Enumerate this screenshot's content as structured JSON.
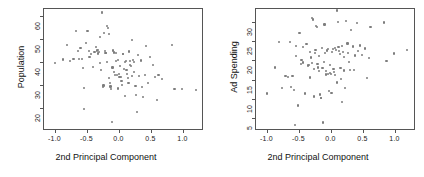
{
  "figure": {
    "type": "scatter-matrix-pair",
    "panel_count": 2,
    "point_color": "#7d7d7d",
    "axis_color": "#555555"
  },
  "chart_data": [
    {
      "type": "scatter",
      "title": "",
      "xlabel": "2nd Principal Component",
      "ylabel": "Population",
      "xlim": [
        -1.18,
        1.32
      ],
      "ylim": [
        10.5,
        63.5
      ],
      "xticks": [
        -1.0,
        -0.5,
        0.0,
        0.5,
        1.0
      ],
      "xticklabels": [
        "-1.0",
        "-0.5",
        "0.0",
        "0.5",
        "1.0"
      ],
      "yticks": [
        20,
        30,
        40,
        50,
        60
      ],
      "yticklabels": [
        "20",
        "30",
        "40",
        "50",
        "60"
      ],
      "grid": false,
      "legend": false,
      "n_points": 100,
      "points": [
        [
          -1.01,
          40.1
        ],
        [
          -0.88,
          41.6
        ],
        [
          -0.82,
          47.8
        ],
        [
          -0.78,
          41.0
        ],
        [
          -0.72,
          41.9
        ],
        [
          -0.68,
          54.1
        ],
        [
          -0.65,
          45.2
        ],
        [
          -0.63,
          41.9
        ],
        [
          -0.61,
          46.4
        ],
        [
          -0.59,
          41.8
        ],
        [
          -0.57,
          37.7
        ],
        [
          -0.56,
          29.2
        ],
        [
          -0.55,
          19.9
        ],
        [
          -0.52,
          48.9
        ],
        [
          -0.5,
          54.0
        ],
        [
          -0.48,
          45.4
        ],
        [
          -0.47,
          42.6
        ],
        [
          -0.44,
          43.8
        ],
        [
          -0.41,
          38.3
        ],
        [
          -0.39,
          44.9
        ],
        [
          -0.37,
          47.0
        ],
        [
          -0.35,
          45.5
        ],
        [
          -0.34,
          44.2
        ],
        [
          -0.33,
          45.8
        ],
        [
          -0.32,
          44.8
        ],
        [
          -0.31,
          40.0
        ],
        [
          -0.3,
          51.5
        ],
        [
          -0.29,
          37.0
        ],
        [
          -0.28,
          61.9
        ],
        [
          -0.27,
          62.2
        ],
        [
          -0.26,
          29.7
        ],
        [
          -0.25,
          30.3
        ],
        [
          -0.24,
          52.9
        ],
        [
          -0.23,
          45.3
        ],
        [
          -0.22,
          44.5
        ],
        [
          -0.21,
          44.4
        ],
        [
          -0.2,
          40.6
        ],
        [
          -0.19,
          56.0
        ],
        [
          -0.18,
          55.3
        ],
        [
          -0.17,
          52.6
        ],
        [
          -0.16,
          33.4
        ],
        [
          -0.15,
          31.2
        ],
        [
          -0.14,
          29.8
        ],
        [
          -0.13,
          28.9
        ],
        [
          -0.12,
          14.3
        ],
        [
          -0.11,
          38.1
        ],
        [
          -0.1,
          45.5
        ],
        [
          -0.09,
          44.6
        ],
        [
          -0.08,
          36.3
        ],
        [
          -0.07,
          35.0
        ],
        [
          -0.06,
          44.3
        ],
        [
          -0.05,
          40.8
        ],
        [
          -0.04,
          34.7
        ],
        [
          -0.03,
          41.2
        ],
        [
          -0.02,
          29.0
        ],
        [
          -0.01,
          35.3
        ],
        [
          0.0,
          33.8
        ],
        [
          0.01,
          38.6
        ],
        [
          0.02,
          34.1
        ],
        [
          0.03,
          32.2
        ],
        [
          0.04,
          30.5
        ],
        [
          0.05,
          43.8
        ],
        [
          0.06,
          44.0
        ],
        [
          0.07,
          37.3
        ],
        [
          0.08,
          25.7
        ],
        [
          0.09,
          40.3
        ],
        [
          0.1,
          41.0
        ],
        [
          0.11,
          36.9
        ],
        [
          0.12,
          35.4
        ],
        [
          0.13,
          33.5
        ],
        [
          0.14,
          31.4
        ],
        [
          0.15,
          45.0
        ],
        [
          0.16,
          40.9
        ],
        [
          0.17,
          39.3
        ],
        [
          0.18,
          38.8
        ],
        [
          0.19,
          34.3
        ],
        [
          0.2,
          50.1
        ],
        [
          0.21,
          41.5
        ],
        [
          0.22,
          40.4
        ],
        [
          0.23,
          36.0
        ],
        [
          0.25,
          30.0
        ],
        [
          0.26,
          26.2
        ],
        [
          0.27,
          18.8
        ],
        [
          0.29,
          43.5
        ],
        [
          0.31,
          34.4
        ],
        [
          0.33,
          41.1
        ],
        [
          0.35,
          29.6
        ],
        [
          0.37,
          25.2
        ],
        [
          0.4,
          34.9
        ],
        [
          0.42,
          47.3
        ],
        [
          0.45,
          31.4
        ],
        [
          0.48,
          42.8
        ],
        [
          0.52,
          39.0
        ],
        [
          0.55,
          34.0
        ],
        [
          0.58,
          23.9
        ],
        [
          0.61,
          35.0
        ],
        [
          0.66,
          33.2
        ],
        [
          0.82,
          47.8
        ],
        [
          0.86,
          28.6
        ],
        [
          0.98,
          28.8
        ],
        [
          1.2,
          28.2
        ]
      ]
    },
    {
      "type": "scatter",
      "title": "",
      "xlabel": "2nd Principal Component",
      "ylabel": "Ad Spending",
      "xlim": [
        -1.18,
        1.32
      ],
      "ylim": [
        2.0,
        33.5
      ],
      "xticks": [
        -1.0,
        -0.5,
        0.0,
        0.5,
        1.0
      ],
      "xticklabels": [
        "-1.0",
        "-0.5",
        "0.0",
        "0.5",
        "1.0"
      ],
      "yticks": [
        5,
        10,
        15,
        20,
        25,
        30
      ],
      "yticklabels": [
        "5",
        "10",
        "15",
        "20",
        "25",
        "30"
      ],
      "grid": false,
      "legend": false,
      "n_points": 100,
      "points": [
        [
          -1.01,
          11.7
        ],
        [
          -0.88,
          18.4
        ],
        [
          -0.82,
          25.0
        ],
        [
          -0.78,
          13.2
        ],
        [
          -0.72,
          16.2
        ],
        [
          -0.68,
          16.0
        ],
        [
          -0.65,
          25.0
        ],
        [
          -0.63,
          13.3
        ],
        [
          -0.61,
          16.1
        ],
        [
          -0.59,
          12.6
        ],
        [
          -0.57,
          3.6
        ],
        [
          -0.56,
          23.9
        ],
        [
          -0.55,
          21.3
        ],
        [
          -0.52,
          8.6
        ],
        [
          -0.5,
          27.4
        ],
        [
          -0.48,
          19.2
        ],
        [
          -0.47,
          20.3
        ],
        [
          -0.44,
          19.7
        ],
        [
          -0.41,
          11.7
        ],
        [
          -0.39,
          24.5
        ],
        [
          -0.37,
          18.9
        ],
        [
          -0.35,
          19.0
        ],
        [
          -0.34,
          15.8
        ],
        [
          -0.33,
          22.3
        ],
        [
          -0.32,
          21.0
        ],
        [
          -0.31,
          19.5
        ],
        [
          -0.3,
          31.1
        ],
        [
          -0.29,
          30.8
        ],
        [
          -0.28,
          10.9
        ],
        [
          -0.27,
          18.0
        ],
        [
          -0.26,
          22.2
        ],
        [
          -0.25,
          23.0
        ],
        [
          -0.24,
          29.1
        ],
        [
          -0.23,
          28.9
        ],
        [
          -0.22,
          19.3
        ],
        [
          -0.21,
          18.4
        ],
        [
          -0.2,
          21.4
        ],
        [
          -0.19,
          17.5
        ],
        [
          -0.18,
          11.4
        ],
        [
          -0.17,
          10.6
        ],
        [
          -0.16,
          10.5
        ],
        [
          -0.15,
          23.5
        ],
        [
          -0.14,
          18.3
        ],
        [
          -0.13,
          4.2
        ],
        [
          -0.12,
          19.9
        ],
        [
          -0.11,
          29.5
        ],
        [
          -0.1,
          22.2
        ],
        [
          -0.09,
          16.6
        ],
        [
          -0.08,
          17.5
        ],
        [
          -0.07,
          22.8
        ],
        [
          -0.06,
          23.2
        ],
        [
          -0.05,
          16.7
        ],
        [
          -0.04,
          12.4
        ],
        [
          -0.03,
          19.0
        ],
        [
          -0.02,
          17.0
        ],
        [
          -0.01,
          16.8
        ],
        [
          0.0,
          11.9
        ],
        [
          0.01,
          22.5
        ],
        [
          0.02,
          23.1
        ],
        [
          0.03,
          18.1
        ],
        [
          0.04,
          17.3
        ],
        [
          0.05,
          16.4
        ],
        [
          0.06,
          23.4
        ],
        [
          0.07,
          22.9
        ],
        [
          0.08,
          14.5
        ],
        [
          0.09,
          33.1
        ],
        [
          0.1,
          30.2
        ],
        [
          0.11,
          23.7
        ],
        [
          0.12,
          22.6
        ],
        [
          0.13,
          21.8
        ],
        [
          0.14,
          18.2
        ],
        [
          0.15,
          15.4
        ],
        [
          0.16,
          9.4
        ],
        [
          0.17,
          24.0
        ],
        [
          0.18,
          22.4
        ],
        [
          0.19,
          21.2
        ],
        [
          0.2,
          17.6
        ],
        [
          0.21,
          13.2
        ],
        [
          0.23,
          30.4
        ],
        [
          0.25,
          24.6
        ],
        [
          0.26,
          22.1
        ],
        [
          0.27,
          19.8
        ],
        [
          0.29,
          17.7
        ],
        [
          0.31,
          28.1
        ],
        [
          0.33,
          23.8
        ],
        [
          0.35,
          17.8
        ],
        [
          0.37,
          21.5
        ],
        [
          0.4,
          29.8
        ],
        [
          0.42,
          22.7
        ],
        [
          0.45,
          24.1
        ],
        [
          0.48,
          21.6
        ],
        [
          0.52,
          23.3
        ],
        [
          0.55,
          15.6
        ],
        [
          0.58,
          20.9
        ],
        [
          0.61,
          28.8
        ],
        [
          0.82,
          30.0
        ],
        [
          0.86,
          20.0
        ],
        [
          0.98,
          22.0
        ],
        [
          1.18,
          23.0
        ],
        [
          -0.45,
          23.6
        ]
      ]
    }
  ]
}
